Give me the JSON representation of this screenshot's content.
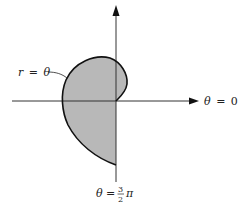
{
  "figure": {
    "curve_label": {
      "var": "r",
      "eq": "=",
      "theta": "θ"
    },
    "axis_label_right": {
      "theta": "θ",
      "eq": "=",
      "value": "0"
    },
    "axis_label_bottom": {
      "theta": "θ",
      "eq": "=",
      "num": "3",
      "den": "2",
      "pi": "π"
    },
    "colors": {
      "fill": "#b8b8b8",
      "stroke": "#111111",
      "axis": "#333333"
    }
  }
}
